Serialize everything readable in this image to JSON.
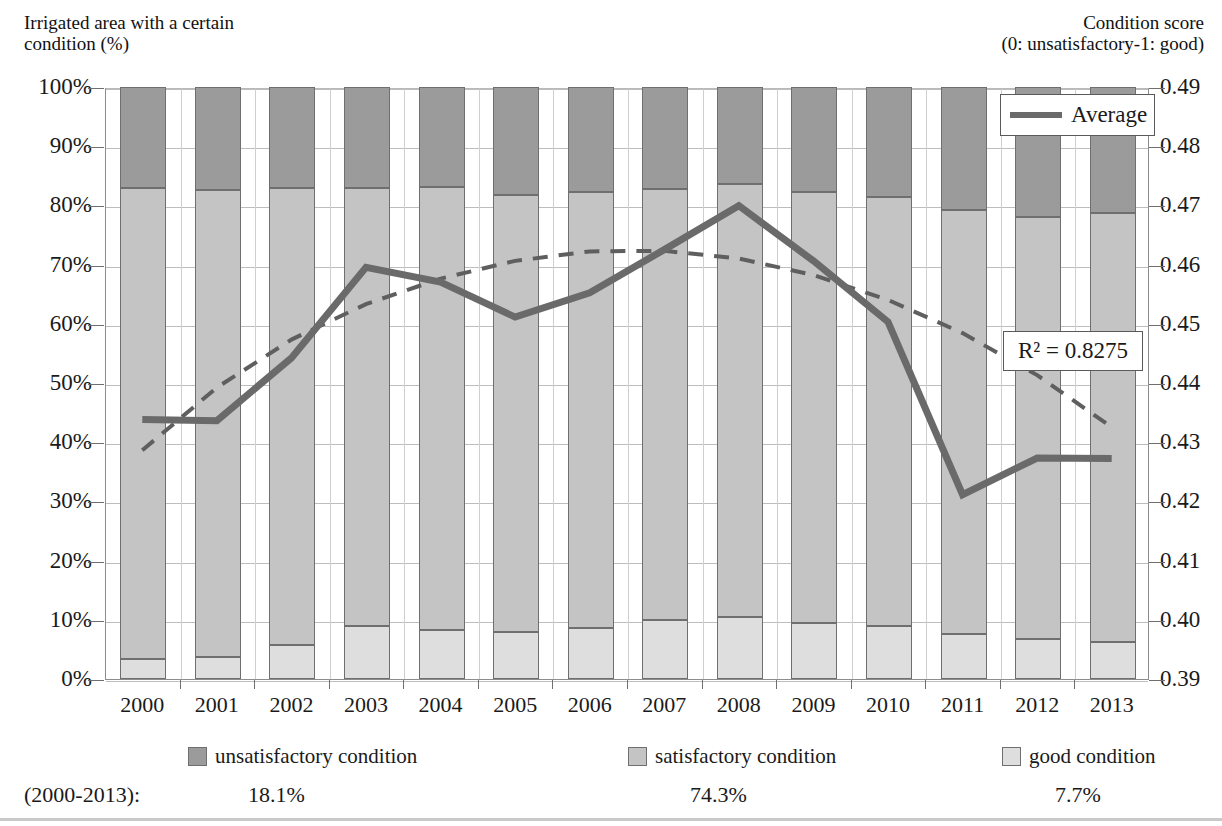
{
  "axes": {
    "left_title": "Irrigated area with a certain\ncondition (%)",
    "right_title": "Condition score\n(0: unsatisfactory-1: good)"
  },
  "legend": {
    "average_label": "Average",
    "items": [
      {
        "label": "unsatisfactory condition",
        "color": "#9b9b9b"
      },
      {
        "label": "satisfactory condition",
        "color": "#c4c4c4"
      },
      {
        "label": "good condition",
        "color": "#dedede"
      }
    ]
  },
  "annotations": {
    "r2_label": "R² = 0.8275"
  },
  "footer": {
    "period_label": "(2000-2013):",
    "values": [
      "18.1%",
      "74.3%",
      "7.7%"
    ]
  },
  "chart_data": {
    "type": "bar",
    "title": "",
    "xlabel": "",
    "ylabel": "Irrigated area with a certain condition (%)",
    "y2label": "Condition score (0: unsatisfactory-1: good)",
    "grid": true,
    "legend_position": "bottom",
    "categories": [
      "2000",
      "2001",
      "2002",
      "2003",
      "2004",
      "2005",
      "2006",
      "2007",
      "2008",
      "2009",
      "2010",
      "2011",
      "2012",
      "2013"
    ],
    "ylim": [
      0,
      100
    ],
    "yticks": [
      "0%",
      "10%",
      "20%",
      "30%",
      "40%",
      "50%",
      "60%",
      "70%",
      "80%",
      "90%",
      "100%"
    ],
    "y2lim": [
      0.39,
      0.49
    ],
    "y2ticks": [
      "0.39",
      "0.40",
      "0.41",
      "0.42",
      "0.43",
      "0.44",
      "0.45",
      "0.46",
      "0.47",
      "0.48",
      "0.49"
    ],
    "stacked": true,
    "series": [
      {
        "name": "good condition",
        "axis": "left",
        "color": "#dedede",
        "values": [
          3.4,
          3.7,
          5.7,
          9.0,
          8.2,
          7.9,
          8.6,
          10.0,
          10.4,
          9.4,
          8.9,
          7.6,
          6.8,
          6.3
        ]
      },
      {
        "name": "satisfactory condition",
        "axis": "left",
        "color": "#c4c4c4",
        "values": [
          79.6,
          78.9,
          77.2,
          74.0,
          74.9,
          73.9,
          73.7,
          72.8,
          73.2,
          72.8,
          72.5,
          71.6,
          71.2,
          72.4
        ]
      },
      {
        "name": "unsatisfactory condition",
        "axis": "left",
        "color": "#9b9b9b",
        "values": [
          17.0,
          17.4,
          17.1,
          17.0,
          16.9,
          18.2,
          17.7,
          17.2,
          16.4,
          17.8,
          18.6,
          20.8,
          22.0,
          21.3
        ]
      },
      {
        "name": "Average",
        "type": "line",
        "axis": "right",
        "color": "#6a6a6a",
        "values": [
          0.434,
          0.4338,
          0.4444,
          0.4597,
          0.4572,
          0.4513,
          0.4554,
          0.4627,
          0.4701,
          0.4608,
          0.4505,
          0.4213,
          0.4275,
          0.4274
        ]
      },
      {
        "name": "Trend",
        "type": "line-dashed",
        "axis": "right",
        "color": "#5f5f5f",
        "values": [
          0.4288,
          0.4394,
          0.4475,
          0.4535,
          0.4578,
          0.4608,
          0.4624,
          0.4625,
          0.4612,
          0.4584,
          0.4542,
          0.4486,
          0.4415,
          0.4327
        ]
      }
    ]
  }
}
